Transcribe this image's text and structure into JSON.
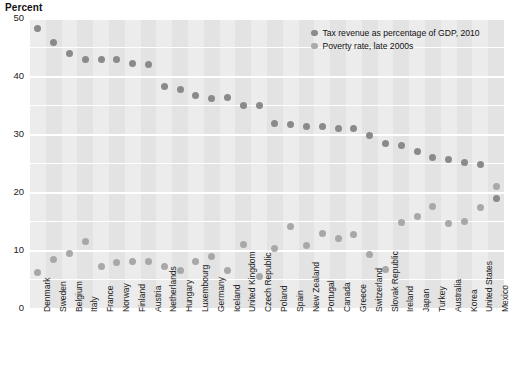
{
  "chart_data": {
    "type": "scatter",
    "title": "",
    "ylabel": "Percent",
    "xlabel": "",
    "ylim": [
      0,
      50
    ],
    "yticks": [
      0,
      10,
      20,
      30,
      40,
      50
    ],
    "ytick_labels": [
      "0",
      "10",
      "20",
      "30",
      "40",
      "50"
    ],
    "gridlines_every": 5,
    "grid": true,
    "legend_position": "top-right",
    "categories": [
      "Denmark",
      "Sweden",
      "Belgium",
      "Italy",
      "France",
      "Norway",
      "Finland",
      "Austria",
      "Netherlands",
      "Hungary",
      "Luxembourg",
      "Germany",
      "Iceland",
      "United Kingdom",
      "Czech Republic",
      "Poland",
      "Spain",
      "New Zealand",
      "Portugal",
      "Canada",
      "Greece",
      "Switzerland",
      "Slovak Republic",
      "Ireland",
      "Japan",
      "Turkey",
      "Australia",
      "Korea",
      "United States",
      "Mexico"
    ],
    "series": [
      {
        "name": "Tax revenue as percentage of GDP, 2010",
        "color": "#8a8a8a",
        "values": [
          48.2,
          45.8,
          43.8,
          42.9,
          42.9,
          42.9,
          42.1,
          42.0,
          38.2,
          37.6,
          36.7,
          36.1,
          36.3,
          35.0,
          34.9,
          31.8,
          31.7,
          31.3,
          31.3,
          31.0,
          30.9,
          29.8,
          28.4,
          28.0,
          26.9,
          26.0,
          25.6,
          25.1,
          24.8,
          18.8
        ]
      },
      {
        "name": "Poverty rate, late  2000s",
        "color": "#a8a8a8",
        "values": [
          6.1,
          8.4,
          9.4,
          11.4,
          7.2,
          7.8,
          8.0,
          8.1,
          7.2,
          6.4,
          8.1,
          8.9,
          6.4,
          11.0,
          5.4,
          10.2,
          14.0,
          10.8,
          12.9,
          12.0,
          12.6,
          9.3,
          6.6,
          14.8,
          15.7,
          17.5,
          14.6,
          15.0,
          17.3,
          21.0
        ]
      }
    ]
  },
  "legend": {
    "entries": [
      {
        "label": "Tax revenue as percentage of GDP, 2010",
        "marker": "tax-series-dot"
      },
      {
        "label": "Poverty rate, late  2000s",
        "marker": "poverty-series-dot"
      }
    ]
  },
  "colors": {
    "plot_background": "#ececec",
    "band": "#e3e3e3",
    "gridline": "#ffffff",
    "tax_series": "#8a8a8a",
    "poverty_series": "#a8a8a8",
    "text": "#1a1a1a"
  }
}
